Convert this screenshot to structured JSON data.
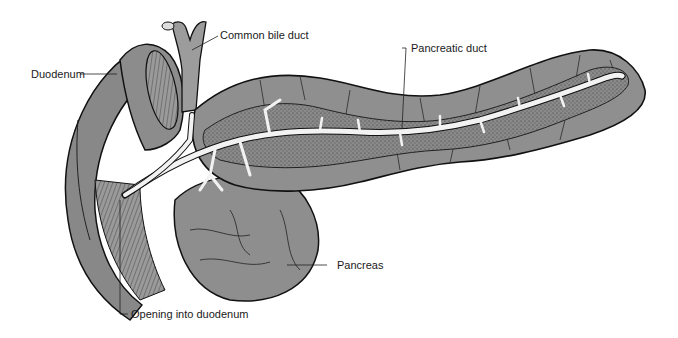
{
  "figure": {
    "labels": {
      "common_bile_duct": "Common bile duct",
      "duodenum": "Duodenum",
      "pancreatic_duct": "Pancreatic duct",
      "pancreas": "Pancreas",
      "opening_into_duodenum": "Opening into duodenum"
    },
    "colors": {
      "tissue": "#8f8f8f",
      "tissue_light": "#a6a6a6",
      "stippled_core": "#7a7a7a",
      "duct": "#f2f2f2",
      "outline": "#111111",
      "background": "#ffffff"
    }
  }
}
